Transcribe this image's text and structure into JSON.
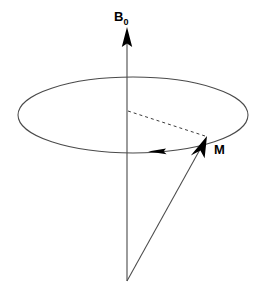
{
  "figure": {
    "background_color": "#ffffff",
    "stroke_color": "#000000",
    "width": 263,
    "height": 296
  },
  "labels": {
    "field_axis": {
      "symbol": "B",
      "subscript": "0",
      "name": "B0",
      "x": 114,
      "y": 10
    },
    "magnetization": {
      "symbol": "M",
      "name": "M",
      "x": 214,
      "y": 143
    }
  },
  "geometry": {
    "origin": {
      "x": 127,
      "y": 281
    },
    "field_axis": {
      "x": 127,
      "top_y": 27,
      "bottom_y": 281,
      "arrowhead_tip": {
        "x": 127,
        "y": 27
      },
      "arrowhead_base_y": 46,
      "arrowhead_half_width": 5
    },
    "precession_ellipse": {
      "center_x": 133,
      "center_y": 115,
      "radius_x": 115,
      "radius_y": 38
    },
    "rotation_arrow": {
      "position": {
        "x": 164,
        "y": 151
      },
      "direction": "left",
      "length": 16
    },
    "magnetization_vector": {
      "from": {
        "x": 127,
        "y": 281
      },
      "to": {
        "x": 207,
        "y": 137
      },
      "arrowhead_length": 22,
      "arrowhead_half_width": 5
    },
    "dashed_radius": {
      "from": {
        "x": 128,
        "y": 111
      },
      "to": {
        "x": 205,
        "y": 136
      },
      "dash_pattern": "3,3"
    }
  },
  "colors": {
    "ink": "#000000",
    "thin_line": "#4a4a4a",
    "paper": "#ffffff"
  }
}
